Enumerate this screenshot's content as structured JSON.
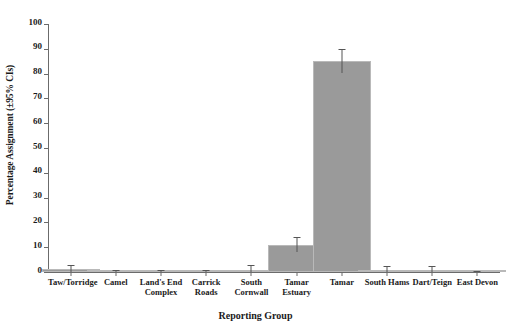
{
  "chart_data": {
    "type": "bar",
    "title": "",
    "xlabel": "Reporting Group",
    "ylabel": "Percentage Assignment (±95% CIs)",
    "ylim": [
      0,
      100
    ],
    "yticks": [
      0,
      10,
      20,
      30,
      40,
      50,
      60,
      70,
      80,
      90,
      100
    ],
    "grid": false,
    "legend": "none",
    "bar_color": "#9a9a9a",
    "error_color": "#555555",
    "axis_color": "#6b6b6b",
    "categories": [
      "Taw/Torridge",
      "Camel",
      "Land's End Complex",
      "Carrick Roads",
      "South Cornwall",
      "Tamar Estuary",
      "Tamar",
      "South Hams",
      "Dart/Teign",
      "East Devon"
    ],
    "category_lines": [
      [
        "Taw/Torridge"
      ],
      [
        "Camel"
      ],
      [
        "Land's End",
        "Complex"
      ],
      [
        "Carrick Roads"
      ],
      [
        "South",
        "Cornwall"
      ],
      [
        "Tamar",
        "Estuary"
      ],
      [
        "Tamar"
      ],
      [
        "South Hams"
      ],
      [
        "Dart/Teign"
      ],
      [
        "East Devon"
      ]
    ],
    "values": [
      1.2,
      0.15,
      0.15,
      0.15,
      1.0,
      10.8,
      85.0,
      0.8,
      0.7,
      0.1
    ],
    "errors_upper": [
      2.6,
      0.3,
      0.3,
      0.3,
      2.3,
      13.6,
      89.6,
      2.0,
      1.9,
      0.2
    ],
    "errors_lower": [
      0.0,
      0.0,
      0.0,
      0.0,
      0.0,
      8.0,
      80.4,
      0.0,
      0.0,
      0.0
    ]
  }
}
